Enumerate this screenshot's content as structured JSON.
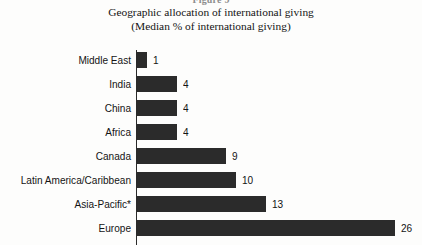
{
  "figure_stub": "Figure 9",
  "title": {
    "line1": "Geographic allocation of international giving",
    "line2": "(Median % of international giving)"
  },
  "colors": {
    "bar": "#2b2b2b",
    "axis": "#2a2a2a",
    "text": "#141414",
    "background": "#fdfdfc"
  },
  "chart_data": {
    "type": "bar",
    "orientation": "horizontal",
    "title": "Geographic allocation of international giving (Median % of international giving)",
    "xlabel": "",
    "ylabel": "",
    "categories": [
      "Middle East",
      "India",
      "China",
      "Africa",
      "Canada",
      "Latin America/Caribbean",
      "Asia-Pacific*",
      "Europe"
    ],
    "values": [
      1,
      4,
      4,
      4,
      9,
      10,
      13,
      26
    ],
    "value_labels": [
      "1",
      "4",
      "4",
      "4",
      "9",
      "10",
      "13",
      "26"
    ],
    "xlim": [
      0,
      26
    ],
    "grid": false,
    "legend": false,
    "units": "percent"
  }
}
